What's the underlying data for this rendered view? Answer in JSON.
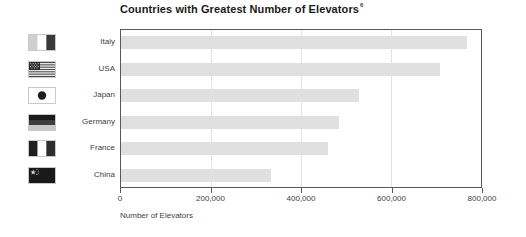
{
  "chart_data": {
    "type": "bar",
    "orientation": "horizontal",
    "title": "Countries with Greatest Number of Elevators",
    "title_footnote_marker": "6",
    "xlabel": "Number of Elevators",
    "ylabel": "",
    "categories": [
      "Italy",
      "USA",
      "Japan",
      "Germany",
      "France",
      "China"
    ],
    "values": [
      765000,
      706000,
      526000,
      482000,
      457000,
      331000
    ],
    "series": [
      {
        "name": "Number of Elevators",
        "values": [
          765000,
          706000,
          526000,
          482000,
          457000,
          331000
        ]
      }
    ],
    "xlim": [
      0,
      800000
    ],
    "xticks": [
      0,
      200000,
      400000,
      600000,
      800000
    ],
    "xtick_labels": [
      "0",
      "200,000",
      "400,000",
      "600,000",
      "800,000"
    ],
    "grid": "vertical",
    "legend": "none",
    "bar_color": "#e0e0e0",
    "axis_color": "#58595b",
    "gridline_color": "#e3e3e3",
    "text_color": "#414042"
  },
  "flags": [
    {
      "country": "Italy",
      "icon": "flag-italy-icon",
      "colors": [
        "#cccccc",
        "#ffffff",
        "#3a3a3a"
      ],
      "layout": "vertical-tricolor"
    },
    {
      "country": "USA",
      "icon": "flag-usa-icon",
      "colors": [
        "#4a4a4a",
        "#ffffff",
        "#2b2b2b"
      ],
      "layout": "stars-and-stripes"
    },
    {
      "country": "Japan",
      "icon": "flag-japan-icon",
      "colors": [
        "#ffffff",
        "#1f1f1f"
      ],
      "layout": "center-disc"
    },
    {
      "country": "Germany",
      "icon": "flag-germany-icon",
      "colors": [
        "#1a1a1a",
        "#3d3d3d",
        "#c8c8c8"
      ],
      "layout": "horizontal-tricolor"
    },
    {
      "country": "France",
      "icon": "flag-france-icon",
      "colors": [
        "#1f1f1f",
        "#ffffff",
        "#2e2e2e"
      ],
      "layout": "vertical-tricolor"
    },
    {
      "country": "China",
      "icon": "flag-china-icon",
      "colors": [
        "#1a1a1a",
        "#d9d9d9"
      ],
      "layout": "stars-canton"
    }
  ]
}
